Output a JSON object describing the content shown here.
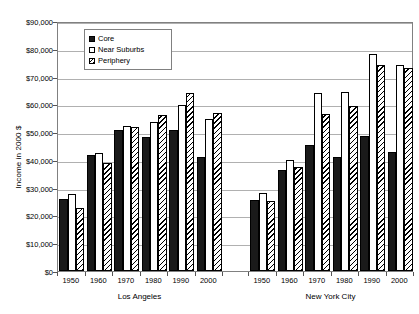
{
  "chart_data": {
    "type": "bar",
    "title": "",
    "xlabel": "",
    "ylabel": "Income in 2000 $",
    "ylim": [
      0,
      90000
    ],
    "ytick_step": 10000,
    "ytick_labels": [
      "$0",
      "$10,000",
      "$20,000",
      "$30,000",
      "$40,000",
      "$50,000",
      "$60,000",
      "$70,000",
      "$80,000",
      "$90,000"
    ],
    "ytick_values": [
      0,
      10000,
      20000,
      30000,
      40000,
      50000,
      60000,
      70000,
      80000,
      90000
    ],
    "grid": true,
    "legend_position": "top-left-inside",
    "groups": [
      "Los Angeles",
      "New York City"
    ],
    "categories": [
      "1950",
      "1960",
      "1970",
      "1980",
      "1990",
      "2000"
    ],
    "series": [
      {
        "name": "Core",
        "key": "core"
      },
      {
        "name": "Near Suburbs",
        "key": "near"
      },
      {
        "name": "Periphery",
        "key": "peri"
      }
    ],
    "data": {
      "Los Angeles": {
        "1950": {
          "core": 25800,
          "near": 27600,
          "peri": 22700
        },
        "1960": {
          "core": 41800,
          "near": 42400,
          "peri": 39000
        },
        "1970": {
          "core": 50700,
          "near": 52300,
          "peri": 51700
        },
        "1980": {
          "core": 48100,
          "near": 53700,
          "peri": 56000
        },
        "1990": {
          "core": 50600,
          "near": 59600,
          "peri": 64000
        },
        "2000": {
          "core": 41000,
          "near": 54600,
          "peri": 57000
        }
      },
      "New York City": {
        "1950": {
          "core": 25600,
          "near": 28000,
          "peri": 25100
        },
        "1960": {
          "core": 36400,
          "near": 40100,
          "peri": 37400
        },
        "1970": {
          "core": 45200,
          "near": 64000,
          "peri": 56400
        },
        "1980": {
          "core": 41100,
          "near": 64300,
          "peri": 59400
        },
        "1990": {
          "core": 48700,
          "near": 78300,
          "peri": 74300
        },
        "2000": {
          "core": 43000,
          "near": 74300,
          "peri": 73000
        }
      }
    }
  }
}
